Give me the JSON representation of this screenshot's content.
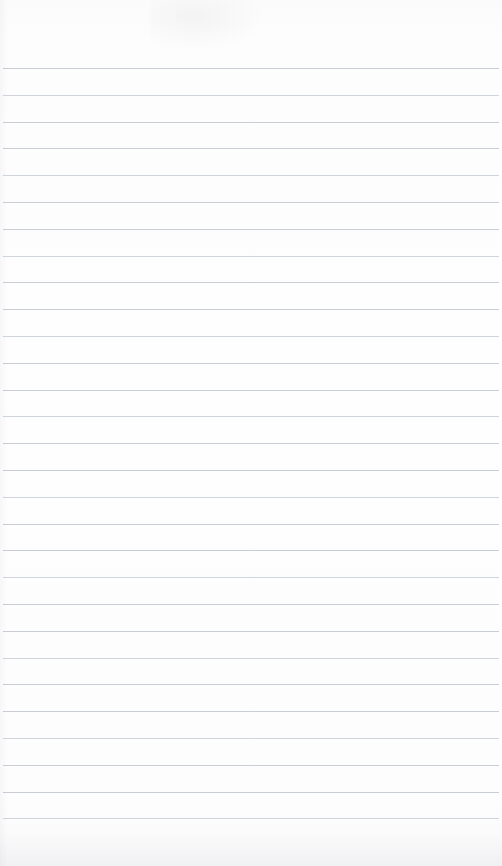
{
  "document": {
    "type": "ruled-notepad-page",
    "title": "Blank Ruled Notepad Page",
    "content_text": "",
    "is_blank": true,
    "page_width_px": 502,
    "page_height_px": 866,
    "paper_color": "#fdfdfd",
    "rule_color": "#c6cad2",
    "rule_count": 29,
    "rule_spacing_px": 26.8,
    "first_rule_y_px": 68,
    "last_rule_y_px": 836,
    "rule_left_x_px": 3,
    "rule_right_x_px": 499,
    "top_margin_px": 68,
    "bottom_margin_px": 30,
    "handwriting": "",
    "printed_text": "",
    "artifacts": [
      {
        "name": "scan-smudge-top",
        "description": "faint gray smudge in the upper centre of the page"
      },
      {
        "name": "scan-shadow-bottom",
        "description": "faint gray scanner shadow along the bottom edge"
      },
      {
        "name": "scan-shadow-left",
        "description": "faint gray scanner shadow along the left edge"
      }
    ]
  }
}
